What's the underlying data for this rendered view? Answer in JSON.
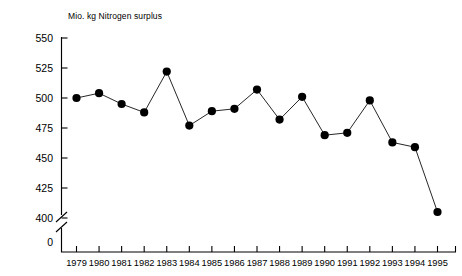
{
  "chart_data": {
    "type": "line",
    "title": "Mio. kg Nitrogen surplus",
    "xlabel": "",
    "ylabel": "",
    "categories": [
      "1979",
      "1980",
      "1981",
      "1982",
      "1983",
      "1984",
      "1985",
      "1986",
      "1987",
      "1988",
      "1989",
      "1990",
      "1991",
      "1992",
      "1993",
      "1994",
      "1995"
    ],
    "values": [
      500,
      504,
      495,
      488,
      522,
      477,
      489,
      491,
      507,
      482,
      501,
      469,
      471,
      498,
      463,
      459,
      405
    ],
    "ylim": [
      400,
      550
    ],
    "yticks": [
      0,
      400,
      425,
      450,
      475,
      500,
      525,
      550
    ],
    "ytick_labels": [
      "0",
      "400",
      "425",
      "450",
      "475",
      "500",
      "525",
      "550"
    ],
    "axis_break": true,
    "axis_break_between": [
      0,
      400
    ],
    "grid": false,
    "legend": "none",
    "marker": "filled-circle",
    "series_color": "#000000"
  },
  "axis": {
    "y_labels": [
      "550",
      "525",
      "500",
      "475",
      "450",
      "425",
      "400",
      "0"
    ],
    "x_labels": [
      "1979",
      "1980",
      "1981",
      "1982",
      "1983",
      "1984",
      "1985",
      "1986",
      "1987",
      "1988",
      "1989",
      "1990",
      "1991",
      "1992",
      "1993",
      "1994",
      "1995"
    ]
  }
}
